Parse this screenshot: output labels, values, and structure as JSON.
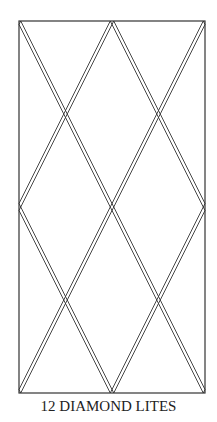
{
  "diagram": {
    "caption": "12 DIAMOND LITES",
    "stroke_color": "#333333",
    "frame": {
      "x": 19,
      "y": 21,
      "width": 186,
      "height": 372
    },
    "lattice": {
      "columns": 2,
      "rows": 4,
      "rail_offset_px": 3.5
    }
  }
}
